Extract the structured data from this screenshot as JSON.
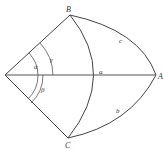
{
  "diagram": {
    "type": "spherical-triangle",
    "background": "#ffffff",
    "line_color": "#444444",
    "points": {
      "O": {
        "label": "",
        "x": 5,
        "y": 75
      },
      "A": {
        "label": "A",
        "x": 156,
        "y": 75
      },
      "B": {
        "label": "B",
        "x": 70,
        "y": 15
      },
      "C": {
        "label": "C",
        "x": 68,
        "y": 138
      }
    },
    "sides": {
      "a": {
        "label": "a"
      },
      "b": {
        "label": "b"
      },
      "c": {
        "label": "c"
      }
    },
    "angles": {
      "alpha": {
        "label": "α"
      },
      "beta": {
        "label": "β"
      },
      "gamma": {
        "label": "γ"
      }
    }
  }
}
